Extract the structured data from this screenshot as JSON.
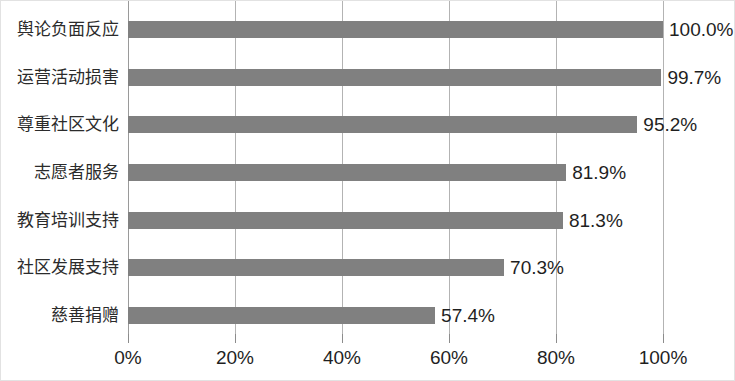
{
  "chart_data": {
    "type": "bar",
    "orientation": "horizontal",
    "title": "",
    "subtitle": "",
    "xlabel": "",
    "ylabel": "",
    "xlim": [
      0,
      100
    ],
    "grid": true,
    "legend": false,
    "legend_position": "none",
    "bar_color": "#808080",
    "gridline_color": "#b3b3b3",
    "text_color": "#1f1f1f",
    "categories": [
      "舆论负面反应",
      "运营活动损害",
      "尊重社区文化",
      "志愿者服务",
      "教育培训支持",
      "社区发展支持",
      "慈善捐赠"
    ],
    "values": [
      100.0,
      99.7,
      95.2,
      81.9,
      81.3,
      70.3,
      57.4
    ],
    "data_labels": [
      "100.0%",
      "99.7%",
      "95.2%",
      "81.9%",
      "81.3%",
      "70.3%",
      "57.4%"
    ],
    "xticks": [
      0,
      20,
      40,
      60,
      80,
      100
    ],
    "xtick_labels": [
      "0%",
      "20%",
      "40%",
      "60%",
      "80%",
      "100%"
    ]
  }
}
